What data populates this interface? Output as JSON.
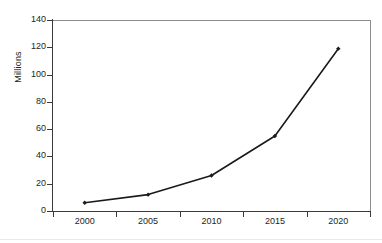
{
  "chart_data": {
    "type": "line",
    "title": "",
    "subtitle": "",
    "xlabel": "",
    "ylabel": "Millions",
    "categories": [
      "2000",
      "2005",
      "2010",
      "2015",
      "2020"
    ],
    "values": [
      6,
      12,
      26,
      55,
      119
    ],
    "series": [
      {
        "name": "Millions",
        "values": [
          6,
          12,
          26,
          55,
          119
        ]
      }
    ],
    "ylim": [
      0,
      140
    ],
    "ytick_labels": [
      "0",
      "20",
      "40",
      "60",
      "80",
      "100",
      "120",
      "140"
    ],
    "ytick_values": [
      0,
      20,
      40,
      60,
      80,
      100,
      120,
      140
    ],
    "xtick_labels": [
      "2000",
      "2005",
      "2010",
      "2015",
      "2020"
    ],
    "grid": "horizontal",
    "legend": "none",
    "annotations": [],
    "marker": "diamond",
    "colors": {
      "background": "#ffffff",
      "plot_background": "#ffffff",
      "line": "#1a1a1a",
      "marker": "#1a1a1a",
      "gridline": "#9a9a9a",
      "axis": "#3a3a3a",
      "text": "#231f20"
    }
  },
  "axis": {
    "y_title": "Millions"
  }
}
